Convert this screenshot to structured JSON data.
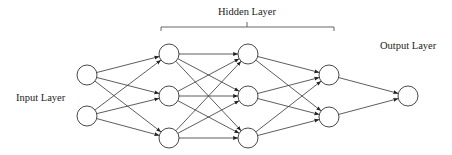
{
  "labels": {
    "input": "Input Layer",
    "hidden": "Hidden Layer",
    "output": "Output Layer"
  },
  "layers": [
    {
      "name": "input",
      "x": 87,
      "ys": [
        75,
        116
      ]
    },
    {
      "name": "hidden-1",
      "x": 169,
      "ys": [
        54,
        96,
        138
      ]
    },
    {
      "name": "hidden-2",
      "x": 248,
      "ys": [
        54,
        96,
        138
      ]
    },
    {
      "name": "hidden-3",
      "x": 329,
      "ys": [
        75,
        117
      ]
    },
    {
      "name": "output",
      "x": 408,
      "ys": [
        96
      ]
    }
  ],
  "node_radius": 10,
  "arrowheads": true
}
